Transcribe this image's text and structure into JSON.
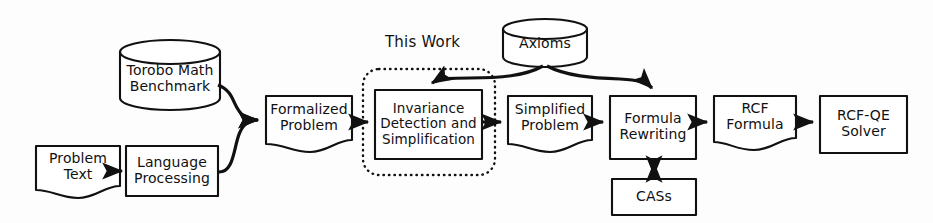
{
  "diagram": {
    "group_caption": "This Work",
    "stroke_color": "#111111",
    "fill_color": "#ffffff",
    "background_color": "#fdfdfd",
    "nodes": {
      "torobo_math_benchmark": {
        "label": "Torobo Math\nBenchmark",
        "shape": "cylinder"
      },
      "problem_text": {
        "label": "Problem\nText",
        "shape": "document"
      },
      "language_processing": {
        "label": "Language\nProcessing",
        "shape": "rectangle"
      },
      "formalized_problem": {
        "label": "Formalized\nProblem",
        "shape": "document"
      },
      "invariance_detection_and_simplification": {
        "label": "Invariance\nDetection and\nSimplification",
        "shape": "rectangle"
      },
      "axioms": {
        "label": "Axioms",
        "shape": "cylinder"
      },
      "simplified_problem": {
        "label": "Simplified\nProblem",
        "shape": "document"
      },
      "formula_rewriting": {
        "label": "Formula\nRewriting",
        "shape": "rectangle"
      },
      "cass": {
        "label": "CASs",
        "shape": "rectangle"
      },
      "rcf_formula": {
        "label": "RCF\nFormula",
        "shape": "document"
      },
      "rcf_qe_solver": {
        "label": "RCF-QE\nSolver",
        "shape": "rectangle"
      }
    },
    "edges": [
      {
        "from": "problem_text",
        "to": "language_processing",
        "style": "solid-arrow"
      },
      {
        "from": "torobo_math_benchmark",
        "to": "formalized_problem",
        "style": "curved-arrow"
      },
      {
        "from": "language_processing",
        "to": "formalized_problem",
        "style": "curved-arrow"
      },
      {
        "from": "formalized_problem",
        "to": "invariance_detection_and_simplification",
        "style": "solid-arrow"
      },
      {
        "from": "axioms",
        "to": "invariance_detection_and_simplification",
        "style": "curved-arrow"
      },
      {
        "from": "axioms",
        "to": "formula_rewriting",
        "style": "curved-arrow"
      },
      {
        "from": "invariance_detection_and_simplification",
        "to": "simplified_problem",
        "style": "solid-arrow"
      },
      {
        "from": "simplified_problem",
        "to": "formula_rewriting",
        "style": "solid-arrow"
      },
      {
        "from": "formula_rewriting",
        "to": "cass",
        "style": "double-arrow"
      },
      {
        "from": "formula_rewriting",
        "to": "rcf_formula",
        "style": "solid-arrow"
      },
      {
        "from": "rcf_formula",
        "to": "rcf_qe_solver",
        "style": "solid-arrow"
      }
    ]
  }
}
